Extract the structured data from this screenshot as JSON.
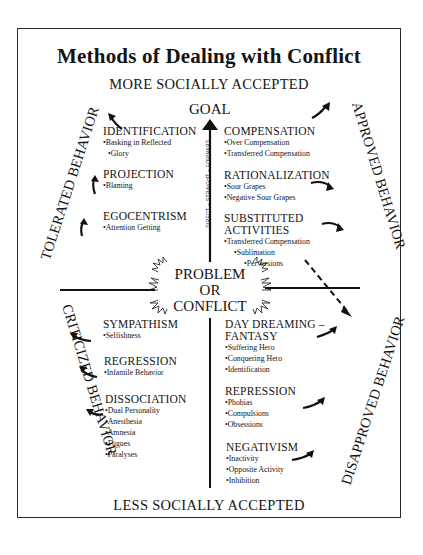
{
  "title": "Methods of Dealing with Conflict",
  "top_label": "MORE SOCIALLY ACCEPTED",
  "bottom_label": "LESS SOCIALLY ACCEPTED",
  "goal_label": "GOAL",
  "axis_label": "DIRECT – STRAIGHT – FORWARD",
  "center": {
    "line1": "PROBLEM",
    "line2": "OR",
    "line3": "CONFLICT"
  },
  "side_labels": {
    "top_left": "TOLERATED BEHAVIOR",
    "top_right": "APPROVED BEHAVIOR",
    "bottom_left": "CRITICIZED BEHAVIOR",
    "bottom_right": "DISAPPROVED BEHAVIOR"
  },
  "quadrants": {
    "top_left": [
      {
        "heading": "IDENTIFICATION",
        "items": [
          "Basking in Reflected",
          "Glory"
        ]
      },
      {
        "heading": "PROJECTION",
        "items": [
          "Blaming"
        ]
      },
      {
        "heading": "EGOCENTRISM",
        "items": [
          "Attention Getting"
        ]
      }
    ],
    "top_right": [
      {
        "heading": "COMPENSATION",
        "items": [
          "Over Compensation",
          "Transferred Compensation"
        ]
      },
      {
        "heading": "RATIONALIZATION",
        "items": [
          "Sour Grapes",
          "Negative Sour Grapes"
        ]
      },
      {
        "heading": "SUBSTITUTED",
        "heading2": "ACTIVITIES",
        "items": [
          "Transferred Compensation",
          "Sublimation",
          "Perversions"
        ]
      }
    ],
    "bottom_left": [
      {
        "heading": "SYMPATHISM",
        "items": [
          "Selfishness"
        ]
      },
      {
        "heading": "REGRESSION",
        "items": [
          "Infantile Behavior"
        ]
      },
      {
        "heading": "DISSOCIATION",
        "items": [
          "Dual Personality",
          "Anesthesia",
          "Amnesia",
          "Fugues",
          "Paralyses"
        ]
      }
    ],
    "bottom_right": [
      {
        "heading": "DAY DREAMING –",
        "heading2": "FANTASY",
        "items": [
          "Suffering Hero",
          "Conquering Hero",
          "Identification"
        ]
      },
      {
        "heading": "REPRESSION",
        "items": [
          "Phobias",
          "Compulsions",
          "Obsessions"
        ]
      },
      {
        "heading": "NEGATIVISM",
        "items": [
          "Inactivity",
          "Opposite Activity",
          "Inhibition"
        ]
      }
    ]
  },
  "colors": {
    "ink": "#141414",
    "background": "#ffffff",
    "frame": "#2a2a2a"
  }
}
